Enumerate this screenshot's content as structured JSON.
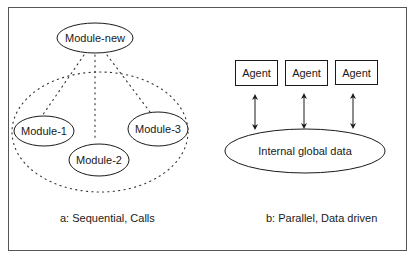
{
  "diagram": {
    "left_panel": {
      "caption": "a: Sequential, Calls",
      "parent_module": {
        "label": "Module-new"
      },
      "group_boundary": {
        "style": "dotted-ellipse"
      },
      "modules": [
        {
          "label": "Module-1"
        },
        {
          "label": "Module-2"
        },
        {
          "label": "Module-3"
        }
      ],
      "connections": [
        {
          "from": "Module-new",
          "to": "Module-1",
          "style": "dotted"
        },
        {
          "from": "Module-new",
          "to": "Module-2",
          "style": "dotted"
        },
        {
          "from": "Module-new",
          "to": "Module-3",
          "style": "dotted"
        }
      ]
    },
    "right_panel": {
      "caption": "b: Parallel, Data driven",
      "agents": [
        {
          "label": "Agent"
        },
        {
          "label": "Agent"
        },
        {
          "label": "Agent"
        }
      ],
      "shared_store": {
        "label": "Internal global data"
      },
      "connections": [
        {
          "from": "Agent",
          "to": "Internal global data",
          "style": "bidirectional-arrow"
        },
        {
          "from": "Agent",
          "to": "Internal global data",
          "style": "bidirectional-arrow"
        },
        {
          "from": "Agent",
          "to": "Internal global data",
          "style": "bidirectional-arrow"
        }
      ]
    },
    "colors": {
      "stroke": "#1a1a1a",
      "border": "#555555",
      "background": "#ffffff"
    }
  }
}
